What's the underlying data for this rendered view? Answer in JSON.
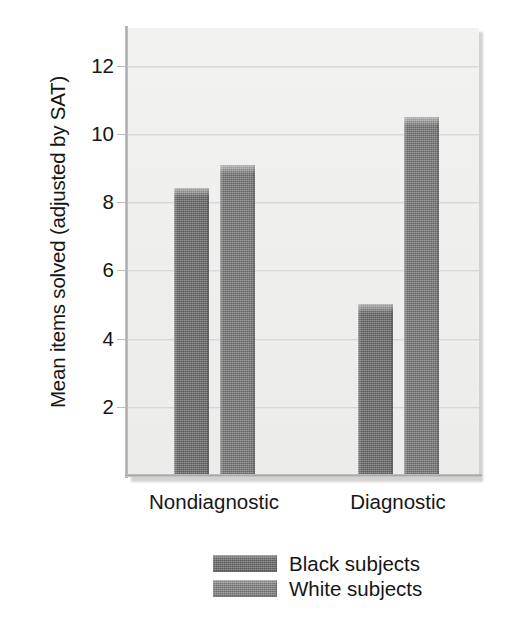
{
  "chart_data": {
    "type": "bar",
    "title": "",
    "subtitle": "",
    "xlabel": "",
    "ylabel": "Mean items solved (adjusted by SAT)",
    "categories": [
      "Nondiagnostic",
      "Diagnostic"
    ],
    "series": [
      {
        "name": "Black subjects",
        "color": "#6f6f6f",
        "values": [
          8.4,
          5.0
        ]
      },
      {
        "name": "White subjects",
        "color": "#7c7c7c",
        "values": [
          9.1,
          10.5
        ]
      }
    ],
    "ylim": [
      0,
      13.1
    ],
    "yticks": [
      2,
      4,
      6,
      8,
      10,
      12
    ],
    "ytick_labels": [
      "2",
      "4",
      "6",
      "8",
      "10",
      "12"
    ],
    "grid": true,
    "legend_position": "bottom-center",
    "plot_background": "#efefee",
    "axis_color": "#a9a9a9",
    "gridline_color": "#d8d8d8",
    "text_color": "#161616"
  }
}
